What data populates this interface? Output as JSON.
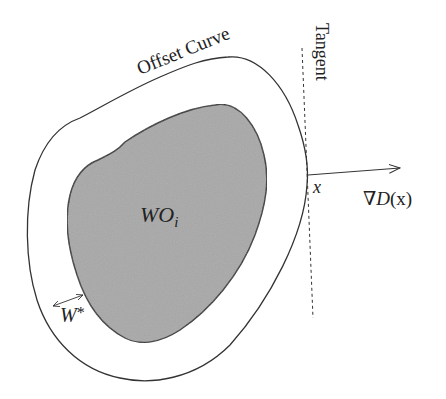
{
  "diagram": {
    "labels": {
      "offset_curve": "Offset Curve",
      "tangent": "Tangent",
      "point": "x",
      "gradient": "∇D(x)",
      "gradient_symbol": "∇",
      "gradient_func": "D",
      "gradient_arg": "(x)",
      "region_main": "WO",
      "region_sub": "i",
      "width_main": "W",
      "width_sup": "*"
    },
    "colors": {
      "background": "#ffffff",
      "stroke": "#333333",
      "obstacle_fill": "#a8a8a8",
      "text": "#222222"
    },
    "elements": [
      {
        "name": "offset-curve",
        "type": "closed-curve",
        "fill": "none"
      },
      {
        "name": "obstacle-region",
        "type": "filled-shape",
        "label": "WO_i"
      },
      {
        "name": "tangent-line",
        "type": "dashed-line"
      },
      {
        "name": "gradient-arrow",
        "type": "arrow",
        "label": "∇D(x)"
      },
      {
        "name": "width-arrow",
        "type": "double-arrow",
        "label": "W*"
      }
    ]
  }
}
